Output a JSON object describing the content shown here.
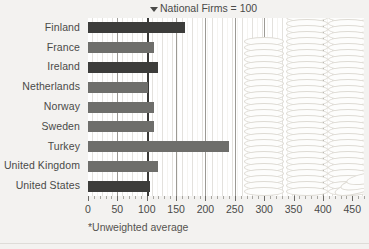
{
  "chart_data": {
    "type": "bar",
    "orientation": "horizontal",
    "title": "National Firms = 100",
    "title_marker": "down-triangle",
    "footnote": "*Unweighted average",
    "xlabel": "",
    "ylabel": "",
    "xlim": [
      0,
      470
    ],
    "xticks": [
      0,
      50,
      100,
      150,
      200,
      250,
      300,
      350,
      400,
      450
    ],
    "xtick_labels": [
      "0",
      "50",
      "100",
      "150",
      "200",
      "250",
      "300",
      "350",
      "400",
      "450"
    ],
    "grid": true,
    "reference_line": 100,
    "reference_label": "National Firms = 100",
    "legend": "none",
    "categories": [
      "Finland",
      "France",
      "Ireland",
      "Netherlands",
      "Norway",
      "Sweden",
      "Turkey",
      "United Kingdom",
      "United States"
    ],
    "values": [
      165,
      113,
      120,
      103,
      112,
      112,
      240,
      120,
      105
    ],
    "bar_shades": [
      "dark",
      "mid",
      "dark",
      "mid",
      "mid",
      "mid",
      "mid",
      "mid",
      "dark"
    ]
  },
  "decoration": {
    "coin_stacks_label": "coin-stacks",
    "stacks": [
      {
        "name": "coin-stack-left",
        "left": 156,
        "width": 40,
        "coins": 26
      },
      {
        "name": "coin-stack-center",
        "left": 198,
        "width": 42,
        "coins": 44
      },
      {
        "name": "coin-stack-right",
        "left": 240,
        "width": 40,
        "coins": 34
      }
    ],
    "tilted_coins": 3
  },
  "colors": {
    "background": "#f3f2f0",
    "plot_background": "#fbfaf8",
    "bar_dark": "#3d3d3b",
    "bar_mid": "#6e6e6b",
    "gridline": "#bfbdb8",
    "gridline_major": "#9c9a95",
    "reference_line": "#3a3a38",
    "text": "#4a4a48",
    "coin_outline": "#dedbd4"
  }
}
